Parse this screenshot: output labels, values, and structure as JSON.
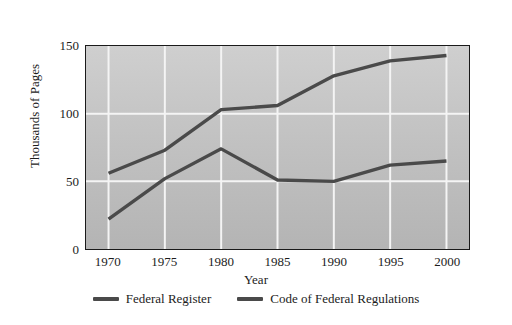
{
  "chart_data": {
    "type": "line",
    "title": "",
    "xlabel": "Year",
    "ylabel": "Thousands of Pages",
    "x": [
      1970,
      1975,
      1980,
      1985,
      1990,
      1995,
      2000
    ],
    "xtick_labels": [
      "1970",
      "1975",
      "1980",
      "1985",
      "1990",
      "1995",
      "2000"
    ],
    "ytick_labels": [
      "0",
      "50",
      "100",
      "150"
    ],
    "yticks": [
      0,
      50,
      100,
      150
    ],
    "xlim": [
      1968,
      2002
    ],
    "ylim": [
      0,
      150
    ],
    "grid": true,
    "grid_color": "#f2f2f2",
    "legend_position": "below",
    "plot_background": "#c4c4c4",
    "line_color": "#4a4a4a",
    "series": [
      {
        "name": "Federal Register",
        "color": "#4a4a4a",
        "values": [
          22,
          52,
          74,
          51,
          50,
          62,
          65
        ]
      },
      {
        "name": "Code of Federal Regulations",
        "color": "#4a4a4a",
        "values": [
          56,
          73,
          103,
          106,
          128,
          139,
          143
        ]
      }
    ]
  },
  "legend": {
    "entries": [
      {
        "label": "Federal Register",
        "color": "#4a4a4a"
      },
      {
        "label": "Code of Federal Regulations",
        "color": "#4a4a4a"
      }
    ]
  }
}
